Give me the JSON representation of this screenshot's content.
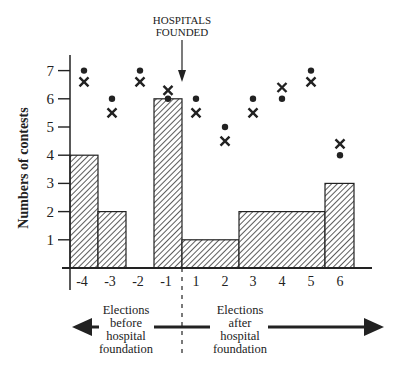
{
  "chart_data": {
    "type": "bar",
    "title": "",
    "annotation": "HOSPITALS FOUNDED",
    "annotation_lines": [
      "HOSPITALS",
      "FOUNDED"
    ],
    "xlabel": "",
    "ylabel": "Numbers of contests",
    "ylim": [
      0,
      7.5
    ],
    "yticks": [
      1,
      2,
      3,
      4,
      5,
      6,
      7
    ],
    "categories": [
      "-4",
      "-3",
      "-2",
      "-1",
      "1",
      "2",
      "3",
      "4",
      "5",
      "6"
    ],
    "series": [
      {
        "name": "contests (hatched bars)",
        "type": "bar",
        "values": [
          4,
          2,
          0,
          6,
          1,
          1,
          2,
          2,
          2,
          3
        ]
      },
      {
        "name": "dot markers",
        "type": "scatter",
        "marker": "dot",
        "values": [
          7,
          6,
          7,
          6,
          6,
          5,
          6,
          6,
          7,
          4
        ]
      },
      {
        "name": "x markers",
        "type": "scatter",
        "marker": "x",
        "values": [
          6.6,
          5.5,
          6.6,
          6.3,
          5.5,
          4.5,
          5.5,
          6.4,
          6.6,
          4.4
        ]
      }
    ],
    "grid": false,
    "legend": null,
    "left_label": [
      "Elections",
      "before",
      "hospital",
      "foundation"
    ],
    "right_label": [
      "Elections",
      "after",
      "hospital",
      "foundation"
    ]
  }
}
